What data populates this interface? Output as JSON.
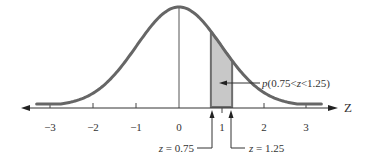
{
  "chart_data": {
    "type": "area",
    "title": "",
    "xlabel": "Z",
    "ylabel": "",
    "xlim": [
      -3.4,
      3.6
    ],
    "ticks": [
      -3,
      -2,
      -1,
      0,
      1,
      2,
      3
    ],
    "tick_labels": [
      "−3",
      "−2",
      "−1",
      "0",
      "1",
      "2",
      "3"
    ],
    "curve": "standard normal density",
    "mean_line_at": 0,
    "shaded_region": {
      "from": 0.75,
      "to": 1.25,
      "fill": "#c8c8c8"
    },
    "annotations": {
      "probability": "p(0.75<z<1.25)",
      "lower_bound": "z = 0.75",
      "upper_bound": "z = 1.25"
    },
    "grid": false,
    "legend": null
  },
  "colors": {
    "curve": "#666666",
    "axis": "#333333",
    "shade": "#c8c8c8",
    "text": "#333333"
  },
  "labels": {
    "axis_name": "Z",
    "tick_m3": "−3",
    "tick_m2": "−2",
    "tick_m1": "−1",
    "tick_0": "0",
    "tick_1": "1",
    "tick_2": "2",
    "tick_3": "3",
    "prob_p": "p",
    "prob_rest": "(0.75<",
    "prob_z": "z",
    "prob_end": "<1.25)",
    "lower_z": "z",
    "lower_val": " = 0.75",
    "upper_z": "z",
    "upper_val": " = 1.25"
  }
}
